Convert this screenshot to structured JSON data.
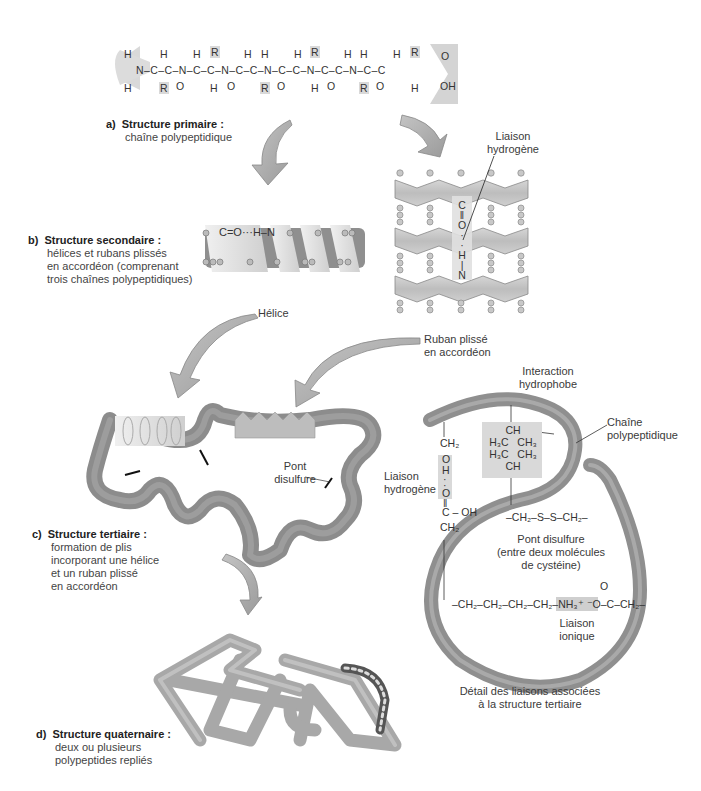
{
  "primary_chain": {
    "formula_backbone": "N–C–C–N–C–C–N–C–C–N–C–C–N–C–C–N–C–C",
    "amino_terminus": {
      "top": "H",
      "bottom": "H",
      "atom": "N"
    },
    "carboxyl_terminus": {
      "double_bond": "O",
      "hydroxyl": "OH"
    },
    "residues": [
      {
        "top": "H",
        "bottom": "R",
        "carbonyl": "O",
        "amide_h": "H"
      },
      {
        "top": "R",
        "bottom": "H",
        "carbonyl": "O",
        "amide_h": "H"
      },
      {
        "top": "H",
        "bottom": "R",
        "carbonyl": "O",
        "amide_h": "H"
      },
      {
        "top": "R",
        "bottom": "H",
        "carbonyl": "O",
        "amide_h": "H"
      },
      {
        "top": "H",
        "bottom": "R",
        "carbonyl": "O",
        "amide_h": "H"
      },
      {
        "top": "R",
        "bottom": "H",
        "carbonyl": "",
        "amide_h": ""
      }
    ]
  },
  "sections": {
    "a": {
      "letter": "a)",
      "title": "Structure primaire :",
      "desc": "chaîne polypeptidique"
    },
    "b": {
      "letter": "b)",
      "title": "Structure secondaire :",
      "desc": "hélices et rubans plissés\nen accordéon (comprenant\ntrois chaînes polypeptidiques)"
    },
    "c": {
      "letter": "c)",
      "title": "Structure tertiaire :",
      "desc": "formation de plis\nincorporant une hélice\net un ruban plissé\nen accordéon"
    },
    "d": {
      "letter": "d)",
      "title": "Structure quaternaire :",
      "desc": "deux ou plusieurs\npolypeptides repliés"
    }
  },
  "secondary": {
    "helix_bond": "C=O···H–N",
    "sheet_label": "Liaison\nhydrogène",
    "sheet_bond": [
      "C",
      "‖",
      "O",
      "·",
      "·",
      "H",
      "|",
      "N"
    ]
  },
  "arrows": {
    "helix_label": "Hélice",
    "sheet_label": "Ruban plissé\nen accordéon"
  },
  "tertiary": {
    "disulfide_label": "Pont\ndisulfure"
  },
  "detail": {
    "hydrophobic_label": "Interaction\nhydrophobe",
    "chain_label": "Chaîne\npolypeptidique",
    "hbond_label": "Liaison\nhydrogène",
    "hbond_chain": [
      "CH₂",
      "O",
      "H",
      "·",
      "·",
      "O",
      "‖",
      "C – OH",
      "CH₂"
    ],
    "hydrophobic_group": [
      "CH",
      "H₃C   CH₃",
      "H₃C   CH₃",
      "CH"
    ],
    "disulfide_formula": "–CH₂–S–S–CH₂–",
    "disulfide_caption": "Pont disulfure\n(entre deux molécules\nde cystéine)",
    "ionic_formula_left": "–CH₂–CH₂–CH₂–CH₂–",
    "ionic_formula_mid": "NH₃⁺ ⁻O",
    "ionic_formula_right": "–C–CH₂–",
    "ionic_carbonyl": "O",
    "ionic_label": "Liaison\nionique",
    "caption": "Détail des liaisons associées\nà la structure tertiaire"
  },
  "colors": {
    "ribbon": "#8f8f8f",
    "ribbon_light": "#c9c9c9",
    "shade": "#d9d9d9",
    "arrow": "#a9a9a9",
    "text": "#333333"
  }
}
